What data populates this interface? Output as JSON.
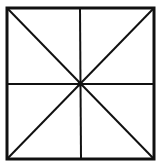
{
  "diagram": {
    "type": "square-with-bisectors-and-diagonals",
    "stroke_color": "#111111",
    "background": "#ffffff",
    "square": {
      "x1": 7,
      "y1": 8,
      "x2": 154,
      "y2": 159
    },
    "center": {
      "x": 80,
      "y": 84
    },
    "lines": [
      "diagonal-main",
      "diagonal-anti",
      "vertical-bisector",
      "horizontal-bisector"
    ]
  }
}
